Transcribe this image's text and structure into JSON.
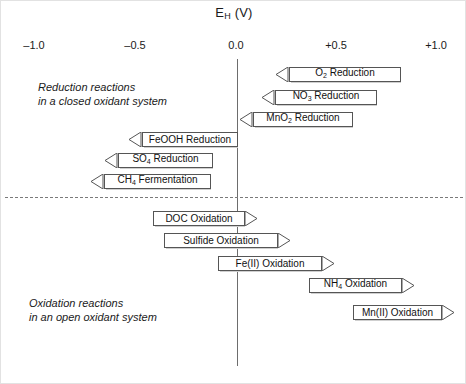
{
  "figure": {
    "axis_title_main": "E",
    "axis_title_sub": "H",
    "axis_title_unit": " (V)"
  },
  "axis": {
    "ticks": [
      {
        "label": "–1.0",
        "value": -1.0,
        "x": 33
      },
      {
        "label": "–0.5",
        "value": -0.5,
        "x": 134
      },
      {
        "label": "0.0",
        "value": 0.0,
        "x": 235
      },
      {
        "label": "+0.5",
        "value": 0.5,
        "x": 335
      },
      {
        "label": "+1.0",
        "value": 1.0,
        "x": 435
      }
    ],
    "zero_line_color": "#6d6d6d",
    "divider_color": "#7a7a7a"
  },
  "captions": {
    "reduction_line1": "Reduction reactions",
    "reduction_line2": "in a closed oxidant system",
    "oxidation_line1": "Oxidation reactions",
    "oxidation_line2": "in an open oxidant system"
  },
  "chart_data": {
    "type": "bar",
    "xlabel": "E_H (V)",
    "ylabel": "",
    "xlim": [
      -1.0,
      1.0
    ],
    "grid": false,
    "legend": "none",
    "orientation": "horizontal",
    "sections": [
      {
        "name": "Reduction reactions in a closed oxidant system",
        "direction": "left",
        "bars": [
          {
            "label": "O",
            "sub": "2",
            "label_tail": " Reduction",
            "full_label": "O2 Reduction",
            "x_start": 0.78,
            "x_end": 0.27,
            "px_left": 275,
            "px_right": 400,
            "px_top": 66
          },
          {
            "label": "NO",
            "sub": "3",
            "label_tail": " Reduction",
            "full_label": "NO3 Reduction",
            "x_start": 0.7,
            "x_end": 0.2,
            "px_left": 261,
            "px_right": 376,
            "px_top": 89
          },
          {
            "label": "MnO",
            "sub": "2",
            "label_tail": " Reduction",
            "full_label": "MnO2 Reduction",
            "x_start": 0.56,
            "x_end": 0.02,
            "px_left": 239,
            "px_right": 352,
            "px_top": 111
          },
          {
            "label": "FeOOH",
            "sub": "",
            "label_tail": " Reduction",
            "full_label": "FeOOH Reduction",
            "x_start": 0.0,
            "x_end": -0.54,
            "px_left": 128,
            "px_right": 237,
            "px_top": 131
          },
          {
            "label": "SO",
            "sub": "4",
            "label_tail": " Reduction",
            "full_label": "SO4 Reduction",
            "x_start": -0.12,
            "x_end": -0.66,
            "px_left": 104,
            "px_right": 212,
            "px_top": 152
          },
          {
            "label": "CH",
            "sub": "4",
            "label_tail": " Fermentation",
            "full_label": "CH4 Fermentation",
            "x_start": -0.17,
            "x_end": -0.73,
            "px_left": 90,
            "px_right": 210,
            "px_top": 173
          }
        ]
      },
      {
        "name": "Oxidation reactions in an open oxidant system",
        "direction": "right",
        "bars": [
          {
            "label": "DOC Oxidation",
            "sub": "",
            "label_tail": "",
            "full_label": "DOC Oxidation",
            "x_start": -0.42,
            "x_end": 0.09,
            "px_left": 152,
            "px_right": 257,
            "px_top": 210
          },
          {
            "label": "Sulfide Oxidation",
            "sub": "",
            "label_tail": "",
            "full_label": "Sulfide Oxidation",
            "x_start": -0.37,
            "x_end": 0.22,
            "px_left": 163,
            "px_right": 290,
            "px_top": 232
          },
          {
            "label": "Fe(II) Oxidation",
            "sub": "",
            "label_tail": "",
            "full_label": "Fe(II) Oxidation",
            "x_start": -0.16,
            "x_end": 0.4,
            "px_left": 217,
            "px_right": 334,
            "px_top": 255
          },
          {
            "label": "NH",
            "sub": "4",
            "label_tail": " Oxidation",
            "full_label": "NH4 Oxidation",
            "x_start": 0.3,
            "x_end": 0.86,
            "px_left": 308,
            "px_right": 414,
            "px_top": 277
          },
          {
            "label": "Mn(II) Oxidation",
            "sub": "",
            "label_tail": "",
            "full_label": "Mn(II) Oxidation",
            "x_start": 0.46,
            "x_end": 1.0,
            "px_left": 352,
            "px_right": 454,
            "px_top": 304
          }
        ]
      }
    ]
  }
}
